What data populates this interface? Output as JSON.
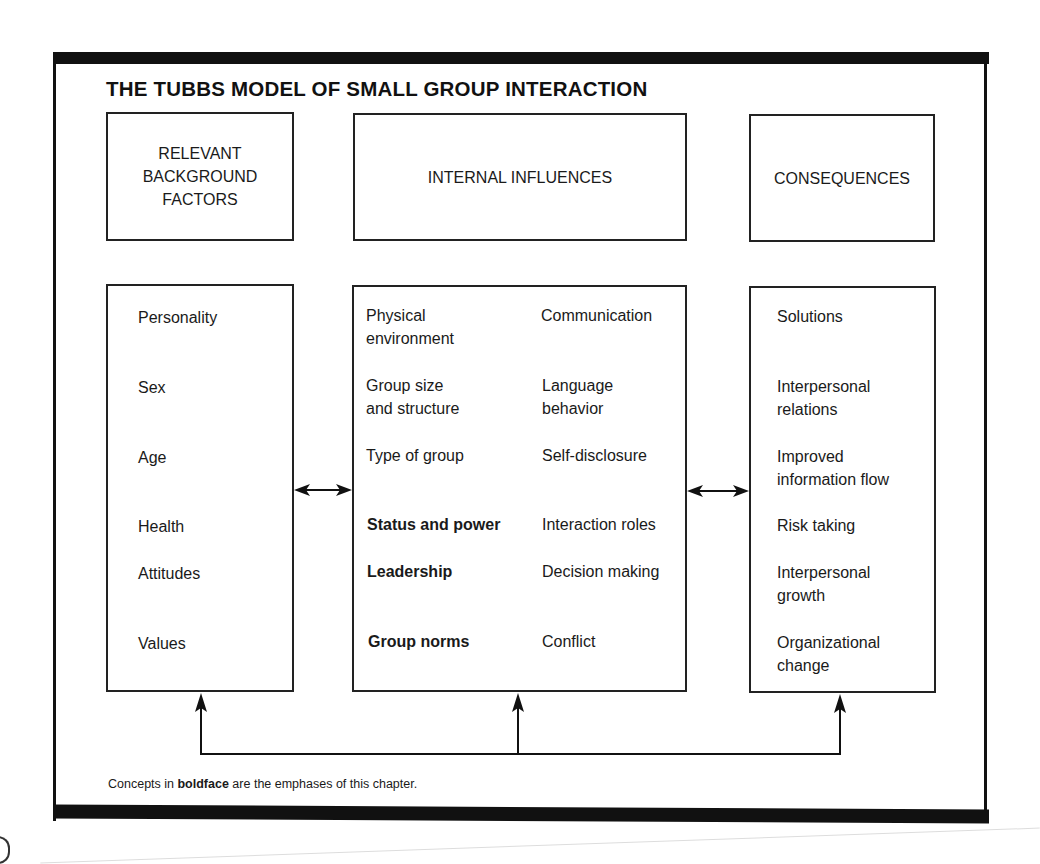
{
  "title": "THE TUBBS MODEL OF SMALL GROUP INTERACTION",
  "headers": {
    "background": "RELEVANT\nBACKGROUND\nFACTORS",
    "internal": "INTERNAL INFLUENCES",
    "consequences": "CONSEQUENCES"
  },
  "background_factors": [
    "Personality",
    "Sex",
    "Age",
    "Health",
    "Attitudes",
    "Values"
  ],
  "internal_influences": {
    "left": [
      {
        "label": "Physical\nenvironment",
        "bold": false
      },
      {
        "label": "Group size\nand structure",
        "bold": false
      },
      {
        "label": "Type of group",
        "bold": false
      },
      {
        "label": "Status and power",
        "bold": true
      },
      {
        "label": "Leadership",
        "bold": true
      },
      {
        "label": "Group norms",
        "bold": true
      }
    ],
    "right": [
      {
        "label": "Communication",
        "bold": false
      },
      {
        "label": "Language\nbehavior",
        "bold": false
      },
      {
        "label": "Self-disclosure",
        "bold": false
      },
      {
        "label": "Interaction roles",
        "bold": false
      },
      {
        "label": "Decision making",
        "bold": false
      },
      {
        "label": "Conflict",
        "bold": false
      }
    ]
  },
  "consequences": [
    "Solutions",
    "Interpersonal\nrelations",
    "Improved\ninformation flow",
    "Risk taking",
    "Interpersonal\ngrowth",
    "Organizational\nchange"
  ],
  "footnote": {
    "prefix": "Concepts in ",
    "bold": "boldface",
    "suffix": " are the emphases of this chapter."
  },
  "edges": [
    {
      "from": "background_factors",
      "to": "internal_influences",
      "type": "bidirectional"
    },
    {
      "from": "internal_influences",
      "to": "consequences",
      "type": "bidirectional"
    },
    {
      "from": "feedback_line",
      "to": "background_factors",
      "type": "directed"
    },
    {
      "from": "feedback_line",
      "to": "internal_influences",
      "type": "directed"
    },
    {
      "from": "feedback_line",
      "to": "consequences",
      "type": "directed"
    }
  ]
}
